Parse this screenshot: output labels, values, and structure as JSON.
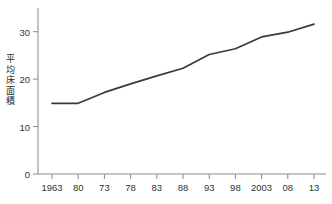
{
  "chart_data": {
    "type": "line",
    "title": "",
    "xlabel": "",
    "ylabel": "平均床面積",
    "categories": [
      "1963",
      "80",
      "73",
      "78",
      "83",
      "88",
      "93",
      "98",
      "2003",
      "08",
      "13"
    ],
    "values": [
      14.9,
      14.9,
      17.2,
      19.0,
      20.7,
      22.3,
      25.2,
      26.4,
      28.9,
      29.9,
      31.6
    ],
    "yticks": [
      0,
      10,
      20,
      30
    ],
    "ylim": [
      0,
      35
    ],
    "grid": false,
    "legend": false,
    "legend_position": "none",
    "series": [
      {
        "name": "平均床面積",
        "values": [
          14.9,
          14.9,
          17.2,
          19.0,
          20.7,
          22.3,
          25.2,
          26.4,
          28.9,
          29.9,
          31.6
        ]
      }
    ],
    "line_color": "#3a3a3a"
  },
  "footnote": {
    "text": ""
  }
}
